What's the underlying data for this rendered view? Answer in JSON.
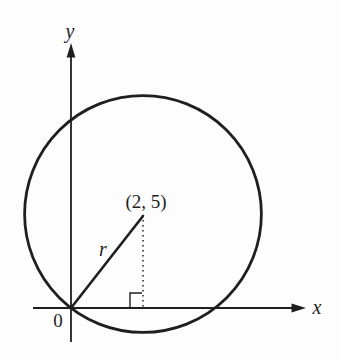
{
  "diagram": {
    "type": "geometry-figure",
    "labels": {
      "y_axis": "y",
      "x_axis": "x",
      "origin": "0",
      "center_point": "(2, 5)",
      "radius": "r"
    },
    "colors": {
      "stroke": "#1f1f1f",
      "background": "#fdfdfd"
    }
  }
}
